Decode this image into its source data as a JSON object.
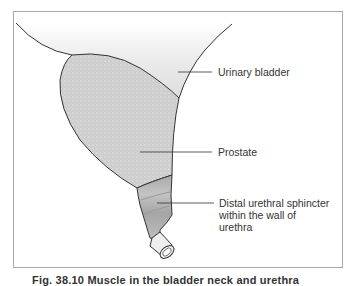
{
  "figure": {
    "labels": {
      "bladder": "Urinary bladder",
      "prostate": "Prostate",
      "sphincter_line1": "Distal urethral sphincter",
      "sphincter_line2": "within the wall of",
      "sphincter_line3": "urethra"
    },
    "caption": "Fig. 38.10 Muscle in the bladder neck and urethra",
    "colors": {
      "frame": "#a8a8a8",
      "outline": "#333333",
      "prostate_fill": "#cfcfcf",
      "bladder_fill": "#e6e6e6",
      "sphincter_fill": "#b5b5b5",
      "text": "#333333"
    }
  }
}
